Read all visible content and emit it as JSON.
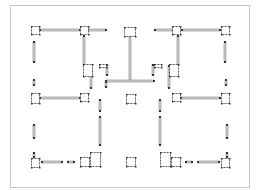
{
  "canvas": {
    "width": 260,
    "height": 190,
    "background": "#ffffff"
  },
  "colors": {
    "frame": "#c8c8c8",
    "bar_fill": "#d4d4d4",
    "bar_stroke": "#6e6e6e",
    "node": "#333333",
    "node_fill": "#ffffff"
  },
  "frame": {
    "x": 10,
    "y": 5,
    "w": 239,
    "h": 182
  },
  "bars": [
    {
      "x1": 40,
      "y1": 30,
      "x2": 80,
      "y2": 30
    },
    {
      "x1": 88,
      "y1": 30,
      "x2": 106,
      "y2": 30
    },
    {
      "x1": 155,
      "y1": 30,
      "x2": 173,
      "y2": 30
    },
    {
      "x1": 182,
      "y1": 30,
      "x2": 220,
      "y2": 30
    },
    {
      "x1": 34,
      "y1": 42,
      "x2": 34,
      "y2": 62
    },
    {
      "x1": 225,
      "y1": 42,
      "x2": 225,
      "y2": 62
    },
    {
      "x1": 84,
      "y1": 36,
      "x2": 84,
      "y2": 65
    },
    {
      "x1": 178,
      "y1": 36,
      "x2": 178,
      "y2": 65
    },
    {
      "x1": 130,
      "y1": 36,
      "x2": 130,
      "y2": 81
    },
    {
      "x1": 106,
      "y1": 81,
      "x2": 154,
      "y2": 81
    },
    {
      "x1": 91,
      "y1": 66,
      "x2": 91,
      "y2": 88
    },
    {
      "x1": 169,
      "y1": 66,
      "x2": 169,
      "y2": 88
    },
    {
      "x1": 107,
      "y1": 65,
      "x2": 107,
      "y2": 75
    },
    {
      "x1": 153,
      "y1": 65,
      "x2": 153,
      "y2": 75
    },
    {
      "x1": 40,
      "y1": 98,
      "x2": 80,
      "y2": 98
    },
    {
      "x1": 181,
      "y1": 98,
      "x2": 220,
      "y2": 98
    },
    {
      "x1": 100,
      "y1": 100,
      "x2": 100,
      "y2": 111
    },
    {
      "x1": 160,
      "y1": 100,
      "x2": 160,
      "y2": 111
    },
    {
      "x1": 100,
      "y1": 117,
      "x2": 100,
      "y2": 145
    },
    {
      "x1": 160,
      "y1": 117,
      "x2": 160,
      "y2": 145
    },
    {
      "x1": 34,
      "y1": 125,
      "x2": 34,
      "y2": 138
    },
    {
      "x1": 227,
      "y1": 125,
      "x2": 227,
      "y2": 138
    },
    {
      "x1": 42,
      "y1": 162,
      "x2": 62,
      "y2": 162
    },
    {
      "x1": 198,
      "y1": 162,
      "x2": 219,
      "y2": 162
    },
    {
      "x1": 68,
      "y1": 162,
      "x2": 74,
      "y2": 162
    },
    {
      "x1": 186,
      "y1": 162,
      "x2": 192,
      "y2": 162
    },
    {
      "x1": 34,
      "y1": 80,
      "x2": 34,
      "y2": 85
    },
    {
      "x1": 226,
      "y1": 80,
      "x2": 226,
      "y2": 85
    },
    {
      "x1": 106,
      "y1": 87,
      "x2": 106,
      "y2": 82
    },
    {
      "x1": 34,
      "y1": 153,
      "x2": 34,
      "y2": 157
    },
    {
      "x1": 227,
      "y1": 153,
      "x2": 227,
      "y2": 157
    }
  ],
  "nodes": [
    {
      "x": 31,
      "y": 26,
      "w": 8,
      "h": 8
    },
    {
      "x": 80,
      "y": 26,
      "w": 8,
      "h": 8
    },
    {
      "x": 124,
      "y": 27,
      "w": 11,
      "h": 9
    },
    {
      "x": 172,
      "y": 26,
      "w": 8,
      "h": 8
    },
    {
      "x": 221,
      "y": 26,
      "w": 8,
      "h": 8
    },
    {
      "x": 83,
      "y": 64,
      "w": 9,
      "h": 12
    },
    {
      "x": 169,
      "y": 64,
      "w": 9,
      "h": 12
    },
    {
      "x": 99,
      "y": 64,
      "w": 7,
      "h": 3
    },
    {
      "x": 154,
      "y": 64,
      "w": 7,
      "h": 3
    },
    {
      "x": 31,
      "y": 93,
      "w": 8,
      "h": 10
    },
    {
      "x": 80,
      "y": 93,
      "w": 8,
      "h": 8
    },
    {
      "x": 172,
      "y": 93,
      "w": 8,
      "h": 8
    },
    {
      "x": 221,
      "y": 93,
      "w": 8,
      "h": 10
    },
    {
      "x": 126,
      "y": 94,
      "w": 9,
      "h": 9
    },
    {
      "x": 31,
      "y": 158,
      "w": 8,
      "h": 9
    },
    {
      "x": 80,
      "y": 157,
      "w": 9,
      "h": 9
    },
    {
      "x": 90,
      "y": 152,
      "w": 10,
      "h": 14
    },
    {
      "x": 160,
      "y": 152,
      "w": 10,
      "h": 14
    },
    {
      "x": 171,
      "y": 157,
      "w": 9,
      "h": 9
    },
    {
      "x": 221,
      "y": 158,
      "w": 8,
      "h": 9
    },
    {
      "x": 126,
      "y": 157,
      "w": 9,
      "h": 9
    }
  ]
}
